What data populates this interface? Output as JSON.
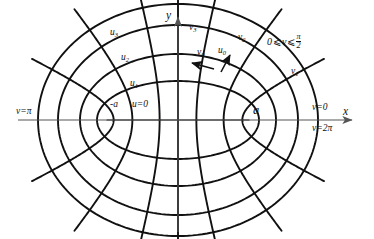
{
  "figure": {
    "line_color": "#111111",
    "axis_color": "#555555",
    "background": "#ffffff"
  },
  "axes": {
    "x_label": "x",
    "y_label": "y",
    "origin": [
      178,
      120
    ],
    "x_axis_y": 120,
    "y_axis_x": 178,
    "x_arrow_tip": [
      355,
      120
    ],
    "y_arrow_tip": [
      178,
      14
    ]
  },
  "foci": {
    "right_label": "a",
    "left_label": "-a",
    "right_point": [
      249,
      120
    ],
    "left_point": [
      107,
      120
    ],
    "c": 71
  },
  "u_labels": [
    {
      "text": "u=0",
      "x": 132,
      "y": 105
    },
    {
      "text": "u",
      "sub": "1",
      "x": 130,
      "y": 84
    },
    {
      "text": "u",
      "sub": "2",
      "x": 121,
      "y": 58
    },
    {
      "text": "u",
      "sub": "3",
      "x": 110,
      "y": 33
    }
  ],
  "v_labels": [
    {
      "text": "v",
      "sub": "1",
      "x": 291,
      "y": 72
    },
    {
      "text": "v",
      "sub": "2",
      "x": 238,
      "y": 38
    },
    {
      "text": "v",
      "sub": "3",
      "x": 189,
      "y": 28
    }
  ],
  "unit_vectors": [
    {
      "text": "v",
      "sub": "0",
      "x": 198,
      "y": 53,
      "arrow_from": [
        214,
        69
      ],
      "arrow_to": [
        192,
        63
      ]
    },
    {
      "text": "u",
      "sub": "0",
      "x": 219,
      "y": 51,
      "arrow_from": [
        221,
        72
      ],
      "arrow_to": [
        230,
        55
      ]
    }
  ],
  "boundary_labels": [
    {
      "name": "v-equals-pi",
      "text": "v=π",
      "x": 16,
      "y": 112
    },
    {
      "name": "v-equals-zero",
      "text": "v=0",
      "x": 313,
      "y": 108
    },
    {
      "name": "v-equals-two-pi",
      "text": "v=2π",
      "x": 313,
      "y": 129
    }
  ],
  "range_note": {
    "lhs": "0",
    "op1": "⩽",
    "var": "v",
    "op2": "⩽",
    "num": "π",
    "den": "2",
    "x": 268,
    "y": 38
  },
  "chart_data": {
    "type": "line",
    "xlabel": "x",
    "ylabel": "y",
    "grid": false,
    "legend": "none",
    "center_px": [
      178,
      120
    ],
    "focal_half_distance_px": 71,
    "x_scale_px_per_unit": 71,
    "y_scale_px_per_unit": 71,
    "u_curves": {
      "description": "Ellipses x = a*cosh(u)*cos(v), y = a*sinh(u)*sin(v); u = const",
      "labels": [
        "u=0",
        "u1",
        "u2",
        "u3"
      ],
      "u_values": [
        0.0,
        0.52,
        0.82,
        1.12,
        1.32
      ],
      "semi_axes_px": [
        {
          "u": 0.0,
          "rx": 71,
          "ry": 0
        },
        {
          "u": 0.52,
          "rx": 81,
          "ry": 39
        },
        {
          "u": 0.82,
          "rx": 98,
          "ry": 66
        },
        {
          "u": 1.12,
          "rx": 120,
          "ry": 95
        },
        {
          "u": 1.32,
          "rx": 140,
          "ry": 116
        }
      ]
    },
    "v_curves": {
      "description": "Hyperbolas x = a*cosh(u)*cos(v), y = a*sinh(u)*sin(v); v = const",
      "labels": [
        "v=0",
        "v1",
        "v2",
        "v3",
        "v=pi",
        "v=2pi"
      ],
      "v_values_deg": [
        0,
        25,
        50,
        75,
        90,
        105,
        130,
        155,
        180,
        205,
        230,
        255,
        270,
        285,
        310,
        335
      ],
      "v_range_text": "0 ⩽ v ⩽ π/2"
    },
    "axis_ranges": {
      "xlim_px": [
        18,
        360
      ],
      "ylim_px": [
        12,
        232
      ]
    }
  }
}
